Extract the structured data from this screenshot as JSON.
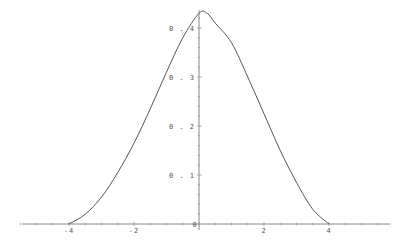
{
  "chart_data": {
    "type": "line",
    "title": "",
    "xlabel": "",
    "ylabel": "",
    "xlim": [
      -5.5,
      5.8
    ],
    "ylim": [
      0,
      0.45
    ],
    "grid": false,
    "legend": null,
    "x_ticks": [
      {
        "value": -4,
        "label": "-4"
      },
      {
        "value": -2,
        "label": "-2"
      },
      {
        "value": 0,
        "label": "0"
      },
      {
        "value": 2,
        "label": "2"
      },
      {
        "value": 4,
        "label": "4"
      }
    ],
    "y_ticks": [
      {
        "value": 0.1,
        "label": "0.1"
      },
      {
        "value": 0.2,
        "label": "0.2"
      },
      {
        "value": 0.3,
        "label": "0.3"
      },
      {
        "value": 0.4,
        "label": "0.4"
      }
    ],
    "series": [
      {
        "name": "density",
        "color": "#555555",
        "x": [
          -4.0,
          -3.5,
          -3.0,
          -2.5,
          -2.0,
          -1.5,
          -1.0,
          -0.5,
          0.0,
          0.25,
          0.5,
          1.0,
          1.5,
          2.0,
          2.5,
          3.0,
          3.5,
          4.0
        ],
        "y": [
          0.0,
          0.02,
          0.055,
          0.105,
          0.165,
          0.235,
          0.31,
          0.38,
          0.43,
          0.43,
          0.41,
          0.37,
          0.3,
          0.225,
          0.15,
          0.085,
          0.03,
          0.0
        ]
      }
    ]
  }
}
